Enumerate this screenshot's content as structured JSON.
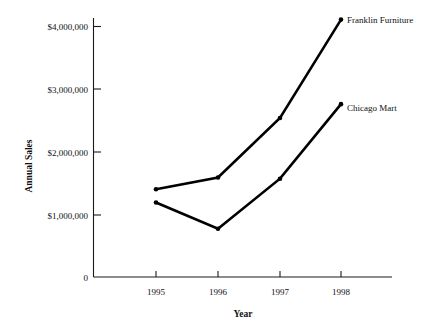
{
  "chart_data": {
    "type": "line",
    "title": "",
    "xlabel": "Year",
    "ylabel": "Annual Sales",
    "categories": [
      "1995",
      "1996",
      "1997",
      "1998"
    ],
    "x": [
      1995,
      1996,
      1997,
      1998
    ],
    "xlim": [
      1994.5,
      1998.6
    ],
    "ylim": [
      0,
      4200000
    ],
    "yticks": [
      0,
      1000000,
      2000000,
      3000000,
      4000000
    ],
    "ytick_labels": [
      "0",
      "$1,000,000",
      "$2,000,000",
      "$3,000,000",
      "$4,000,000"
    ],
    "grid": false,
    "legend_position": "right-endpoint-labels",
    "series": [
      {
        "name": "Franklin Furniture",
        "label": "Franklin Furniture",
        "color": "#000000",
        "values": [
          1400000,
          1590000,
          2540000,
          4110000
        ]
      },
      {
        "name": "Chicago Mart",
        "label": "Chicago Mart",
        "color": "#000000",
        "values": [
          1190000,
          770000,
          1570000,
          2760000
        ]
      }
    ]
  },
  "axes": {
    "y_axis_title": "Annual Sales",
    "x_axis_title": "Year"
  }
}
